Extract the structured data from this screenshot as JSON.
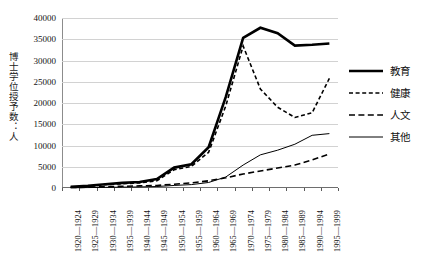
{
  "chart_data": {
    "type": "line",
    "title": "",
    "xlabel": "",
    "ylabel": "博士学位授予数：人",
    "ylim": [
      0,
      40000
    ],
    "ytick_step": 5000,
    "grid": true,
    "legend_position": "right",
    "categories": [
      "1920—1924",
      "1925—1929",
      "1930—1934",
      "1935—1939",
      "1940—1944",
      "1945—1949",
      "1950—1954",
      "1955—1959",
      "1960—1964",
      "1965—1969",
      "1970—1974",
      "1975—1979",
      "1980—1984",
      "1985—1989",
      "1990—1994",
      "1995—1999"
    ],
    "ytick_labels": [
      "0",
      "5000",
      "10000",
      "15000",
      "20000",
      "25000",
      "30000",
      "35000",
      "40000"
    ],
    "series": [
      {
        "name": "教育",
        "style": "thick-solid",
        "color": "#000000",
        "values": [
          300,
          500,
          900,
          1200,
          1400,
          2100,
          4800,
          5600,
          9600,
          21500,
          35300,
          37700,
          36400,
          33500,
          33700,
          34000
        ]
      },
      {
        "name": "健康",
        "style": "fine-dashed",
        "color": "#000000",
        "values": [
          200,
          400,
          800,
          1000,
          1200,
          1700,
          4300,
          5100,
          8400,
          19400,
          33400,
          23300,
          19000,
          16600,
          17700,
          25800
        ]
      },
      {
        "name": "人文",
        "style": "long-dashed",
        "color": "#000000",
        "values": [
          100,
          200,
          300,
          400,
          500,
          600,
          900,
          1200,
          1700,
          2400,
          3300,
          4000,
          4700,
          5400,
          6600,
          8000
        ]
      },
      {
        "name": "其他",
        "style": "thin-solid",
        "color": "#000000",
        "values": [
          50,
          100,
          150,
          200,
          250,
          350,
          600,
          800,
          1300,
          2600,
          5400,
          7800,
          8900,
          10300,
          12400,
          12800
        ]
      }
    ]
  },
  "legend": {
    "items": [
      {
        "label": "教育",
        "style": "thick-solid"
      },
      {
        "label": "健康",
        "style": "fine-dashed"
      },
      {
        "label": "人文",
        "style": "long-dashed"
      },
      {
        "label": "其他",
        "style": "thin-solid"
      }
    ]
  }
}
